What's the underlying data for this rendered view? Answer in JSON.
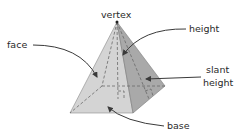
{
  "labels": {
    "vertex": "vertex",
    "face": "face",
    "height": "height",
    "slant_line1": "slant",
    "slant_line2": "height",
    "base": "base"
  },
  "colors": {
    "front_face": "#d4d4d4",
    "right_face": "#a9a9a9",
    "edge": "#7a7a7a",
    "text": "#2a2a2a",
    "arrow": "#3a3a3a"
  }
}
